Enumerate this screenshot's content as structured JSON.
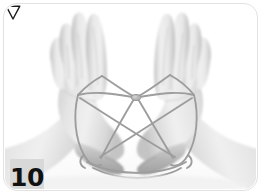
{
  "figure": {
    "kind": "instructional-photo",
    "step_number": "10",
    "caption_text": "",
    "frame_color": "#e2e2e2",
    "badge_bg_color": "#d8d8d8",
    "badge_text_color": "#111111",
    "string_color": "#9a9a9a",
    "annotation": {
      "name": "down-triangle-marker",
      "shape": "triangle-down",
      "fill": "#ffffff",
      "stroke": "#1a1a1a",
      "x": 136,
      "y": 156
    },
    "hands": [
      {
        "name": "left-hand",
        "side": "left",
        "pose": "palm-facing-right-fingers-up"
      },
      {
        "name": "right-hand",
        "side": "right",
        "pose": "palm-facing-left-fingers-up"
      }
    ],
    "string_nodes": [
      {
        "name": "left-index-loop",
        "x": 78,
        "y": 92
      },
      {
        "name": "right-index-loop",
        "x": 186,
        "y": 92
      },
      {
        "name": "center-knot",
        "x": 131,
        "y": 93
      },
      {
        "name": "left-thumb-loop",
        "x": 93,
        "y": 155
      },
      {
        "name": "right-thumb-loop",
        "x": 176,
        "y": 155
      },
      {
        "name": "left-upper-anchor",
        "x": 96,
        "y": 74
      },
      {
        "name": "right-upper-anchor",
        "x": 171,
        "y": 72
      }
    ]
  }
}
